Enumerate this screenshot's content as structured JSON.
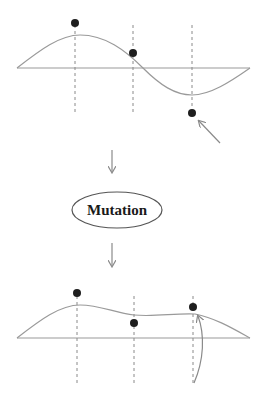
{
  "diagram": {
    "step_label": "Mutation",
    "before": {
      "points": [
        {
          "x": 75,
          "y": 23
        },
        {
          "x": 133,
          "y": 53
        },
        {
          "x": 192,
          "y": 113
        }
      ],
      "mutated_point_index": 2
    },
    "after": {
      "points": [
        {
          "x": 77,
          "y": 293
        },
        {
          "x": 134,
          "y": 323
        },
        {
          "x": 193,
          "y": 307
        }
      ],
      "mutated_point_index": 2
    },
    "colors": {
      "line": "#9a9a9a",
      "dot": "#1e1e1e",
      "text": "#1a1a1a"
    }
  }
}
